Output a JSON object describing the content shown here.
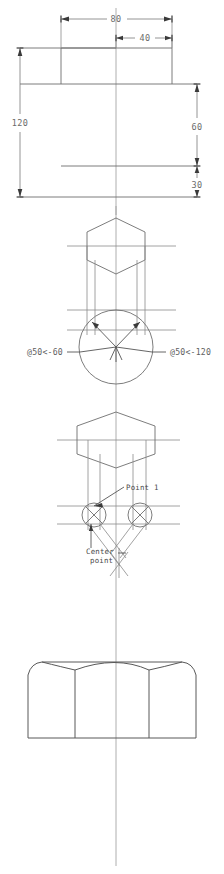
{
  "drawing": {
    "title": "Hexagon nut construction drawing",
    "background_color": "#ffffff",
    "line_color": "#6e6e6e",
    "text_color": "#5f5f5f",
    "views": [
      {
        "name": "dimension-layout-view",
        "label": "Top dimension layout"
      },
      {
        "name": "hexagon-circle-view",
        "label": "Hexagon in circle with polar coordinates"
      },
      {
        "name": "hexagon-arc-view",
        "label": "Hexagon with chamfer arc centers"
      },
      {
        "name": "nut-elevation-view",
        "label": "Finished nut front elevation"
      }
    ]
  },
  "dimensions": {
    "width_overall": "80",
    "width_half": "40",
    "height_overall": "120",
    "height_upper": "60",
    "height_lower": "30"
  },
  "polar_labels": {
    "left": "@50<-60",
    "right": "@50<-120"
  },
  "annotations": {
    "point_1": "Point 1",
    "center_line1": "Center",
    "center_line2": "point"
  }
}
